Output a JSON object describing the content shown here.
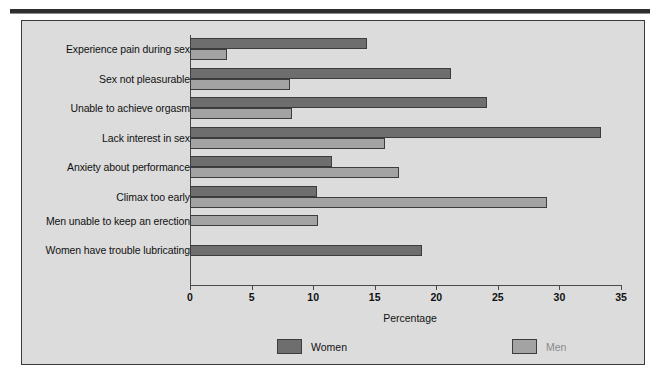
{
  "chart_data": {
    "type": "bar",
    "orientation": "horizontal",
    "title": "",
    "xlabel": "Percentage",
    "ylabel": "",
    "xlim": [
      0,
      35
    ],
    "xticks": [
      0,
      5,
      10,
      15,
      20,
      25,
      30,
      35
    ],
    "grid": false,
    "legend_position": "bottom",
    "categories": [
      "Experience pain during sex",
      "Sex not pleasurable",
      "Unable to achieve orgasm",
      "Lack interest in sex",
      "Anxiety about performance",
      "Climax too early",
      "Men unable to keep an erection",
      "Women have trouble lubricating"
    ],
    "series": [
      {
        "name": "Women",
        "color": "#6e6e6e",
        "values": [
          14.4,
          21.2,
          24.1,
          33.4,
          11.5,
          10.3,
          null,
          18.8
        ]
      },
      {
        "name": "Men",
        "color": "#a3a3a3",
        "values": [
          3.0,
          8.1,
          8.3,
          15.8,
          17.0,
          29.0,
          10.4,
          null
        ]
      }
    ]
  },
  "legend": {
    "items": [
      {
        "label": "Women",
        "swatch": "women"
      },
      {
        "label": "Men",
        "swatch": "men"
      }
    ]
  },
  "axis": {
    "x_title": "Percentage"
  },
  "colors": {
    "women": "#6e6e6e",
    "men": "#a3a3a3",
    "panel_background": "#dcdcdc",
    "panel_border": "#3a3a3a",
    "axis": "#4a4a4a",
    "text": "#111111",
    "men_legend_text": "#8a8a8a"
  }
}
